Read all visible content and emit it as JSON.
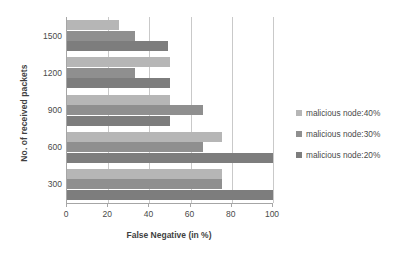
{
  "chart_data": {
    "type": "bar",
    "orientation": "horizontal",
    "title": "",
    "xlabel": "False Negative (in %)",
    "ylabel": "No. of received packets",
    "categories": [
      "1500",
      "1200",
      "900",
      "600",
      "300"
    ],
    "series": [
      {
        "name": "malicious node:40%",
        "color": "#b6b6b6",
        "values": [
          25,
          50,
          50,
          75,
          75
        ]
      },
      {
        "name": "malicious node:30%",
        "color": "#8f8f8f",
        "values": [
          33,
          33,
          66,
          66,
          75
        ]
      },
      {
        "name": "malicious node:20%",
        "color": "#7d7d7d",
        "values": [
          49,
          50,
          50,
          100,
          100
        ]
      }
    ],
    "xlim": [
      0,
      100
    ],
    "xticks": [
      0,
      20,
      40,
      60,
      80,
      100
    ],
    "xtick_labels": [
      "0",
      "20",
      "40",
      "60",
      "80",
      "100"
    ],
    "grid": true,
    "grid_axis": "x",
    "legend_position": "right"
  },
  "legend": {
    "items": [
      {
        "label": "malicious node:40%",
        "swatch": "s40"
      },
      {
        "label": "malicious node:30%",
        "swatch": "s30"
      },
      {
        "label": "malicious node:20%",
        "swatch": "s20"
      }
    ]
  }
}
